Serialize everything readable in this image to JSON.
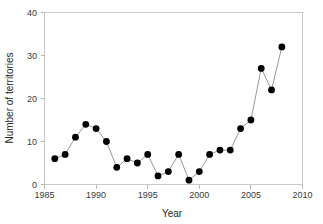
{
  "chart_data": {
    "type": "line",
    "title": "",
    "subtitle": "",
    "xlabel": "Year",
    "ylabel": "Number of territories",
    "xlim": [
      1985,
      2010
    ],
    "ylim": [
      0,
      40
    ],
    "xticks": [
      "1985",
      "1990",
      "1995",
      "2000",
      "2005",
      "2010"
    ],
    "xtick_values": [
      1985,
      1990,
      1995,
      2000,
      2005,
      2010
    ],
    "yticks": [
      "0",
      "10",
      "20",
      "30",
      "40"
    ],
    "ytick_values": [
      0,
      10,
      20,
      30,
      40
    ],
    "grid": false,
    "legend": false,
    "legend_position": "none",
    "marker": "filled-circle",
    "marker_color": "#000000",
    "line_color": "#8c8c8c",
    "x": [
      1986,
      1987,
      1988,
      1989,
      1990,
      1991,
      1992,
      1993,
      1994,
      1995,
      1996,
      1997,
      1998,
      1999,
      2000,
      2001,
      2002,
      2003,
      2004,
      2005,
      2006,
      2007,
      2008
    ],
    "values": [
      6,
      7,
      11,
      14,
      13,
      10,
      4,
      6,
      5,
      7,
      2,
      3,
      7,
      1,
      3,
      7,
      8,
      8,
      13,
      15,
      27,
      22,
      32
    ],
    "series": [
      {
        "name": "Number of territories",
        "x": [
          1986,
          1987,
          1988,
          1989,
          1990,
          1991,
          1992,
          1993,
          1994,
          1995,
          1996,
          1997,
          1998,
          1999,
          2000,
          2001,
          2002,
          2003,
          2004,
          2005,
          2006,
          2007,
          2008
        ],
        "values": [
          6,
          7,
          11,
          14,
          13,
          10,
          4,
          6,
          5,
          7,
          2,
          3,
          7,
          1,
          3,
          7,
          8,
          8,
          13,
          15,
          27,
          22,
          32
        ]
      }
    ],
    "annotations": []
  },
  "axes": {
    "y_title": "Number of territories",
    "x_title": "Year",
    "y_tick_0": "0",
    "y_tick_1": "10",
    "y_tick_2": "20",
    "y_tick_3": "30",
    "y_tick_4": "40",
    "x_tick_0": "1985",
    "x_tick_1": "1990",
    "x_tick_2": "1995",
    "x_tick_3": "2000",
    "x_tick_4": "2005",
    "x_tick_5": "2010"
  },
  "colors": {
    "background": "#ffffff",
    "marker": "#000000",
    "line": "#8c8c8c",
    "frame": "#c9c9c9",
    "text": "#262626"
  }
}
